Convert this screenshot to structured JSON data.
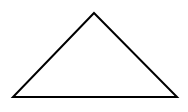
{
  "diagram": {
    "shape": "triangle",
    "type": "obtuse-isosceles",
    "stroke_color": "#000000",
    "fill_color": "#ffffff",
    "background": "#ffffff",
    "stroke_width": 2,
    "vertices": {
      "apex": [
        94,
        13
      ],
      "base_left": [
        13,
        97
      ],
      "base_right": [
        177,
        97
      ]
    }
  }
}
